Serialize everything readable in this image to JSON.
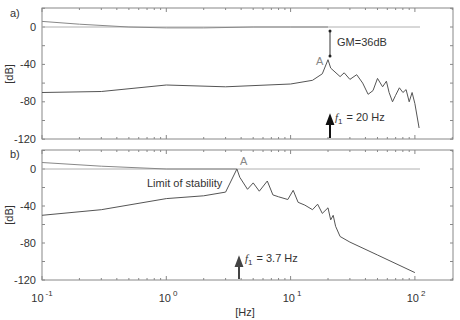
{
  "chart_data": [
    {
      "type": "line",
      "panel_label": "a)",
      "title": "",
      "xlabel": "",
      "ylabel": "[dB]",
      "xscale": "log",
      "xlim": [
        0.1,
        200
      ],
      "ylim": [
        -120,
        20
      ],
      "yticks": [
        0,
        -40,
        -80,
        -120
      ],
      "ytick_labels": [
        "0",
        "-40",
        "-80",
        "-120"
      ],
      "grid": false,
      "series": [
        {
          "name": "0 dB reference",
          "color": "#aaaaaa",
          "x": [
            0.1,
            110
          ],
          "y": [
            0,
            0
          ]
        },
        {
          "name": "upper response",
          "color": "#888888",
          "x": [
            0.1,
            0.2,
            0.5,
            1.0,
            2.0,
            5.0,
            10,
            20
          ],
          "y": [
            6,
            3,
            0,
            -1,
            -1,
            0,
            0,
            0
          ]
        },
        {
          "name": "open-loop magnitude",
          "color": "#444444",
          "x": [
            0.1,
            0.3,
            1.0,
            3.0,
            10,
            15,
            18,
            20,
            21,
            25,
            27,
            30,
            34,
            38,
            42,
            46,
            50,
            55,
            59,
            62,
            66,
            70,
            75,
            80,
            85,
            90,
            95,
            100,
            108
          ],
          "y": [
            -70,
            -69,
            -62,
            -64,
            -61,
            -57,
            -50,
            -35,
            -44,
            -53,
            -49,
            -56,
            -51,
            -60,
            -72,
            -68,
            -55,
            -64,
            -58,
            -70,
            -80,
            -73,
            -65,
            -70,
            -67,
            -80,
            -70,
            -82,
            -108
          ]
        }
      ],
      "annotations": [
        {
          "text": "A",
          "x": 20,
          "y": -35
        },
        {
          "text": "GM=36dB",
          "x": 20,
          "y": -18
        },
        {
          "text": "f1 = 20 Hz",
          "x": 20,
          "y": -105,
          "arrow_at": 20
        }
      ]
    },
    {
      "type": "line",
      "panel_label": "b)",
      "title": "",
      "xlabel": "[Hz]",
      "ylabel": "[dB]",
      "xscale": "log",
      "xlim": [
        0.1,
        200
      ],
      "ylim": [
        -120,
        20
      ],
      "xticks": [
        0.1,
        1,
        10,
        100
      ],
      "xtick_labels": [
        "10^-1",
        "10^0",
        "10^1",
        "10^2"
      ],
      "yticks": [
        0,
        -40,
        -80,
        -120
      ],
      "ytick_labels": [
        "0",
        "-40",
        "-80",
        "-120"
      ],
      "grid": false,
      "series": [
        {
          "name": "0 dB reference",
          "color": "#aaaaaa",
          "x": [
            0.1,
            110
          ],
          "y": [
            0,
            0
          ]
        },
        {
          "name": "upper response",
          "color": "#888888",
          "x": [
            0.1,
            0.3,
            1.0,
            3.7
          ],
          "y": [
            7,
            3,
            0,
            0
          ]
        },
        {
          "name": "open-loop magnitude",
          "color": "#444444",
          "x": [
            0.1,
            0.3,
            1.0,
            2.0,
            3.0,
            3.7,
            3.9,
            4.5,
            5.0,
            5.6,
            6.5,
            7.2,
            8.0,
            9.5,
            10.5,
            11.5,
            13,
            15,
            16.5,
            18,
            20,
            21,
            22,
            23,
            25,
            30,
            50,
            100
          ],
          "y": [
            -50,
            -44,
            -32,
            -29,
            -25,
            0,
            -9,
            -22,
            -15,
            -24,
            -13,
            -28,
            -30,
            -33,
            -23,
            -36,
            -39,
            -44,
            -38,
            -48,
            -42,
            -55,
            -50,
            -62,
            -73,
            -79,
            -93,
            -112
          ]
        }
      ],
      "annotations": [
        {
          "text": "A",
          "x": 3.7,
          "y": 5
        },
        {
          "text": "Limit of stability",
          "x": 1.3,
          "y": -15
        },
        {
          "text": "f1 = 3.7 Hz",
          "x": 3.7,
          "y": -105,
          "arrow_at": 3.7
        }
      ]
    }
  ],
  "figure": {
    "xaxis_unit": "[Hz]",
    "x_tick_base": "10",
    "x_tick_exponents": [
      "-1",
      "0",
      "1",
      "2"
    ]
  },
  "panels": {
    "a": {
      "label": "a)",
      "ylabel": "[dB]",
      "ytick_labels": [
        "0",
        "-40",
        "-80",
        "-120"
      ],
      "point_label": "A",
      "gm_label": "GM=36dB",
      "freq_symbol": "f",
      "freq_subscript": "1",
      "freq_value": "= 20 Hz"
    },
    "b": {
      "label": "b)",
      "ylabel": "[dB]",
      "ytick_labels": [
        "0",
        "-40",
        "-80",
        "-120"
      ],
      "point_label": "A",
      "stability_label": "Limit of stability",
      "freq_symbol": "f",
      "freq_subscript": "1",
      "freq_value": "= 3.7 Hz"
    }
  },
  "colors": {
    "axis": "#888888",
    "reference_line": "#b0b0b0",
    "curve": "#555555",
    "arrow": "#111111",
    "text": "#333333",
    "point_label": "#888888"
  }
}
